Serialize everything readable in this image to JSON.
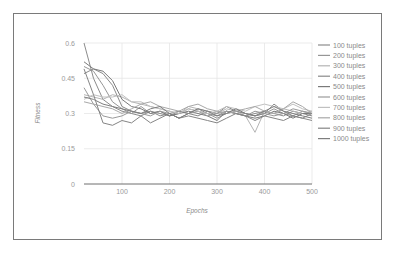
{
  "chart_data": {
    "type": "line",
    "title": "",
    "xlabel": "Epochs",
    "ylabel": "Fitness",
    "xlim": [
      20,
      500
    ],
    "ylim": [
      0,
      0.6
    ],
    "xticks": [
      100,
      200,
      300,
      400,
      500
    ],
    "yticks": [
      0,
      0.15,
      0.3,
      0.45,
      0.6
    ],
    "xtick_labels": [
      "100",
      "200",
      "300",
      "400",
      "500"
    ],
    "ytick_labels": [
      "0",
      "0.15",
      "0.3",
      "0.45",
      "0.6"
    ],
    "grid": true,
    "legend_position": "right",
    "x": [
      20,
      40,
      60,
      80,
      100,
      120,
      140,
      160,
      180,
      200,
      220,
      240,
      260,
      280,
      300,
      320,
      340,
      360,
      380,
      400,
      420,
      440,
      460,
      480,
      500
    ],
    "series": [
      {
        "name": "100 tuples",
        "color": "#8c8c8c",
        "values": [
          0.6,
          0.45,
          0.36,
          0.33,
          0.31,
          0.3,
          0.29,
          0.31,
          0.3,
          0.29,
          0.31,
          0.3,
          0.32,
          0.3,
          0.29,
          0.31,
          0.3,
          0.29,
          0.3,
          0.31,
          0.3,
          0.29,
          0.31,
          0.3,
          0.29
        ]
      },
      {
        "name": "200 tuples",
        "color": "#969696",
        "values": [
          0.5,
          0.48,
          0.42,
          0.35,
          0.32,
          0.3,
          0.33,
          0.3,
          0.31,
          0.29,
          0.3,
          0.32,
          0.31,
          0.3,
          0.28,
          0.3,
          0.31,
          0.3,
          0.29,
          0.3,
          0.32,
          0.3,
          0.29,
          0.31,
          0.3
        ]
      },
      {
        "name": "300 tuples",
        "color": "#b4b4b4",
        "values": [
          0.38,
          0.37,
          0.36,
          0.38,
          0.37,
          0.35,
          0.34,
          0.33,
          0.32,
          0.31,
          0.3,
          0.33,
          0.32,
          0.31,
          0.3,
          0.32,
          0.31,
          0.29,
          0.22,
          0.31,
          0.3,
          0.32,
          0.31,
          0.3,
          0.31
        ]
      },
      {
        "name": "400 tuples",
        "color": "#8a8a8a",
        "values": [
          0.47,
          0.49,
          0.47,
          0.42,
          0.33,
          0.31,
          0.3,
          0.31,
          0.29,
          0.3,
          0.31,
          0.3,
          0.29,
          0.31,
          0.3,
          0.33,
          0.31,
          0.3,
          0.29,
          0.3,
          0.34,
          0.31,
          0.29,
          0.28,
          0.27
        ]
      },
      {
        "name": "500 tuples",
        "color": "#7a7a7a",
        "values": [
          0.52,
          0.49,
          0.48,
          0.44,
          0.36,
          0.33,
          0.32,
          0.3,
          0.31,
          0.29,
          0.3,
          0.31,
          0.3,
          0.29,
          0.27,
          0.31,
          0.3,
          0.29,
          0.28,
          0.29,
          0.31,
          0.3,
          0.28,
          0.3,
          0.3
        ]
      },
      {
        "name": "600 tuples",
        "color": "#9a9a9a",
        "values": [
          0.41,
          0.34,
          0.29,
          0.28,
          0.29,
          0.31,
          0.3,
          0.29,
          0.31,
          0.3,
          0.28,
          0.3,
          0.31,
          0.29,
          0.3,
          0.31,
          0.3,
          0.29,
          0.31,
          0.3,
          0.29,
          0.3,
          0.32,
          0.31,
          0.3
        ]
      },
      {
        "name": "700 tuples",
        "color": "#c0c0c0",
        "values": [
          0.36,
          0.38,
          0.37,
          0.37,
          0.38,
          0.35,
          0.35,
          0.33,
          0.32,
          0.31,
          0.3,
          0.32,
          0.31,
          0.3,
          0.31,
          0.33,
          0.32,
          0.31,
          0.33,
          0.34,
          0.33,
          0.32,
          0.34,
          0.32,
          0.31
        ]
      },
      {
        "name": "800 tuples",
        "color": "#a8a8a8",
        "values": [
          0.35,
          0.34,
          0.33,
          0.32,
          0.3,
          0.32,
          0.34,
          0.35,
          0.33,
          0.32,
          0.31,
          0.33,
          0.34,
          0.32,
          0.31,
          0.3,
          0.31,
          0.32,
          0.33,
          0.31,
          0.3,
          0.32,
          0.35,
          0.33,
          0.3
        ]
      },
      {
        "name": "900 tuples",
        "color": "#858585",
        "values": [
          0.49,
          0.38,
          0.26,
          0.25,
          0.27,
          0.26,
          0.29,
          0.26,
          0.28,
          0.3,
          0.28,
          0.29,
          0.28,
          0.27,
          0.26,
          0.28,
          0.3,
          0.29,
          0.27,
          0.29,
          0.28,
          0.27,
          0.29,
          0.28,
          0.3
        ]
      },
      {
        "name": "1000 tuples",
        "color": "#7e7e7e",
        "values": [
          0.37,
          0.36,
          0.34,
          0.33,
          0.32,
          0.31,
          0.3,
          0.32,
          0.33,
          0.3,
          0.28,
          0.3,
          0.32,
          0.31,
          0.29,
          0.3,
          0.32,
          0.3,
          0.29,
          0.31,
          0.33,
          0.31,
          0.3,
          0.29,
          0.28
        ]
      }
    ]
  }
}
